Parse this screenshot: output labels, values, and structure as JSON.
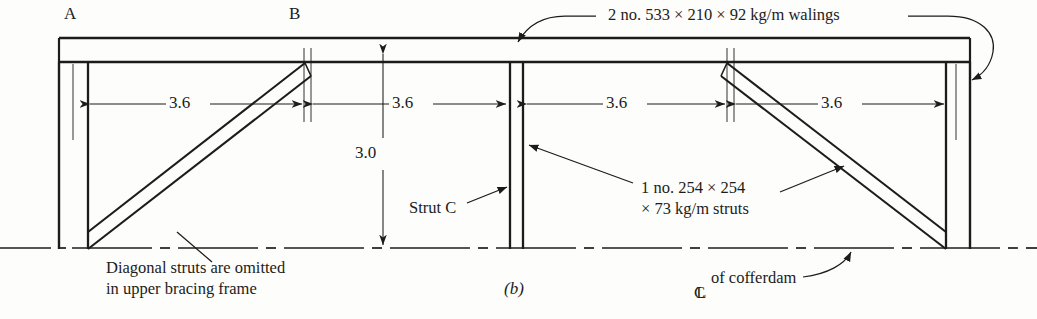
{
  "figure": {
    "label": "(b)",
    "background_color": "#fdfdfb",
    "ink_color": "#1c1c1c"
  },
  "corner_labels": [
    {
      "name": "A",
      "text": "A",
      "x": 64,
      "y": 4
    },
    {
      "name": "B",
      "text": "B",
      "x": 289,
      "y": 4
    }
  ],
  "dimensions": {
    "horizontal_label": "3.6",
    "horizontal_spans": [
      {
        "label": "3.6",
        "x1": 88,
        "x2": 304,
        "text_x": 176,
        "text_y": 93
      },
      {
        "label": "3.6",
        "x1": 311,
        "x2": 508,
        "text_x": 399,
        "text_y": 93
      },
      {
        "label": "3.6",
        "x1": 525,
        "x2": 727,
        "text_x": 613,
        "text_y": 93
      },
      {
        "label": "3.6",
        "x1": 734,
        "x2": 946,
        "text_x": 828,
        "text_y": 93
      }
    ],
    "vertical": {
      "label": "3.0",
      "x": 383,
      "y_top": 40,
      "y_bottom": 248,
      "text_x": 355,
      "text_y": 152
    }
  },
  "annotations": {
    "walings": {
      "text": "2 no. 533 × 210 × 92 kg/m walings",
      "x": 608,
      "y": 5
    },
    "struts": {
      "line1": "1 no. 254 × 254",
      "line2": "× 73 kg/m struts",
      "x": 641,
      "y": 178
    },
    "strut_c": {
      "text": "Strut C",
      "x": 409,
      "y": 198
    },
    "diagonal_note": {
      "line1": "Diagonal struts are omitted",
      "line2": "in upper bracing frame",
      "x": 106,
      "y": 264
    },
    "centreline": {
      "symbol": "₵",
      "text": "of cofferdam",
      "x": 694,
      "y": 272
    }
  },
  "geometry": {
    "waling": {
      "x_left": 59,
      "x_right": 970,
      "y_top": 38,
      "y_bottom": 62
    },
    "centre_dash_line_y": 248,
    "base_y": 232,
    "sheet_pile_left_x": 59,
    "sheet_pile_right_x": 970,
    "columns_x": [
      88,
      510,
      522,
      946
    ],
    "thin_guides_x": [
      73,
      304,
      311,
      727,
      734,
      956
    ],
    "diagonals": [
      {
        "name": "left-diagonal-strut",
        "x1": 88,
        "y1": 232,
        "x2": 305,
        "y2": 63
      },
      {
        "name": "right-diagonal-strut",
        "x1": 946,
        "y1": 232,
        "x2": 727,
        "y2": 63
      }
    ]
  }
}
